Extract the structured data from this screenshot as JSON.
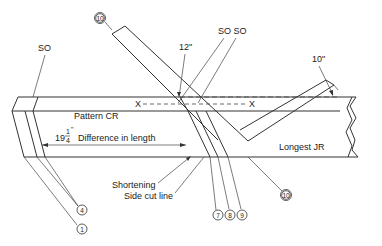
{
  "labels": {
    "so_left": "SO",
    "so_pair": "SO SO",
    "dim_12": "12\"",
    "dim_10": "10\"",
    "x_left": "X",
    "x_right": "X",
    "pattern_cr": "Pattern CR",
    "difference_whole": "19",
    "difference_frac_num": "1",
    "difference_frac_den": "4",
    "difference_inch": "\"",
    "difference_text": "Difference in length",
    "longest_jr": "Longest JR",
    "shortening": "Shortening",
    "side_cut_line": "Side cut line"
  },
  "callouts": [
    {
      "id": "10-top",
      "number": "10"
    },
    {
      "id": "4",
      "number": "4"
    },
    {
      "id": "1",
      "number": "1"
    },
    {
      "id": "7",
      "number": "7"
    },
    {
      "id": "8",
      "number": "8"
    },
    {
      "id": "9",
      "number": "9"
    },
    {
      "id": "10-bottom",
      "number": "10"
    }
  ]
}
